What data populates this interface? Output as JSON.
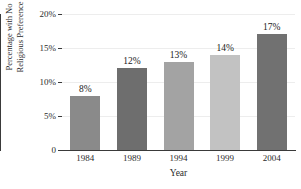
{
  "chart_data": {
    "type": "bar",
    "title": "",
    "xlabel": "Year",
    "ylabel": "Percentage with No Religious Preference",
    "ylabel_line1": "Percentage with No",
    "ylabel_line2": "Religious Preference",
    "categories": [
      "1984",
      "1989",
      "1994",
      "1999",
      "2004"
    ],
    "values": [
      8,
      12,
      13,
      14,
      17
    ],
    "value_labels": [
      "8%",
      "12%",
      "13%",
      "14%",
      "17%"
    ],
    "bar_colors": [
      "#8a8a8a",
      "#6e6e6e",
      "#a3a3a3",
      "#c2c2c2",
      "#717171"
    ],
    "ylim": [
      0,
      20
    ],
    "ytick_values": [
      0,
      5,
      10,
      15,
      20
    ],
    "ytick_labels": [
      "0",
      "5%",
      "10%",
      "15%",
      "20%"
    ],
    "grid": true,
    "legend": "none",
    "background_color": "#ffffff",
    "axis_color": "#3a3a3a",
    "grid_color": "#ededed"
  },
  "figure": {
    "title_remnant": ""
  }
}
